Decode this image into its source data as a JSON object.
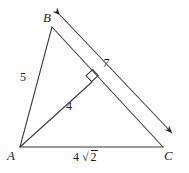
{
  "figure": {
    "kind": "geometry-diagram",
    "background_color": "#fdfdfd",
    "stroke_color": "#3a3a3a",
    "text_color": "#1c1c1c"
  },
  "vertices": [
    {
      "name": "A",
      "label": "A",
      "x": 20,
      "y": 147
    },
    {
      "name": "B",
      "label": "B",
      "x": 52,
      "y": 27
    },
    {
      "name": "C",
      "label": "C",
      "x": 163,
      "y": 147
    }
  ],
  "segments": [
    {
      "name": "side-ab",
      "from": "A",
      "to": "B",
      "length_label": "5"
    },
    {
      "name": "side-bc",
      "from": "B",
      "to": "C",
      "length_label": ""
    },
    {
      "name": "side-ac",
      "from": "A",
      "to": "C",
      "length_label": "4√2"
    },
    {
      "name": "altitude-af",
      "from": "A",
      "to": "F",
      "length_label": "4"
    }
  ],
  "altitude_foot": {
    "name": "F",
    "x": 92,
    "y": 82
  },
  "right_angle_marker": {
    "name": "right-angle-square",
    "at_vertex": "F",
    "size": 9,
    "indicates": "90 degrees"
  },
  "dimension_arrow": {
    "name": "bc-dimension-arrow",
    "double_headed": true,
    "parallel_to": "side-bc",
    "tip_start": {
      "x": 60,
      "y": 15
    },
    "tip_end": {
      "x": 172,
      "y": 133
    },
    "length_label": "7"
  },
  "labels": {
    "vertex_a": "A",
    "vertex_b": "B",
    "vertex_c": "C",
    "side_ab": "5",
    "altitude": "4",
    "dimension": "7",
    "side_ac_coefficient": "4",
    "side_ac_radical": "√",
    "side_ac_radicand": "2",
    "side_ac_full": "4√2"
  }
}
